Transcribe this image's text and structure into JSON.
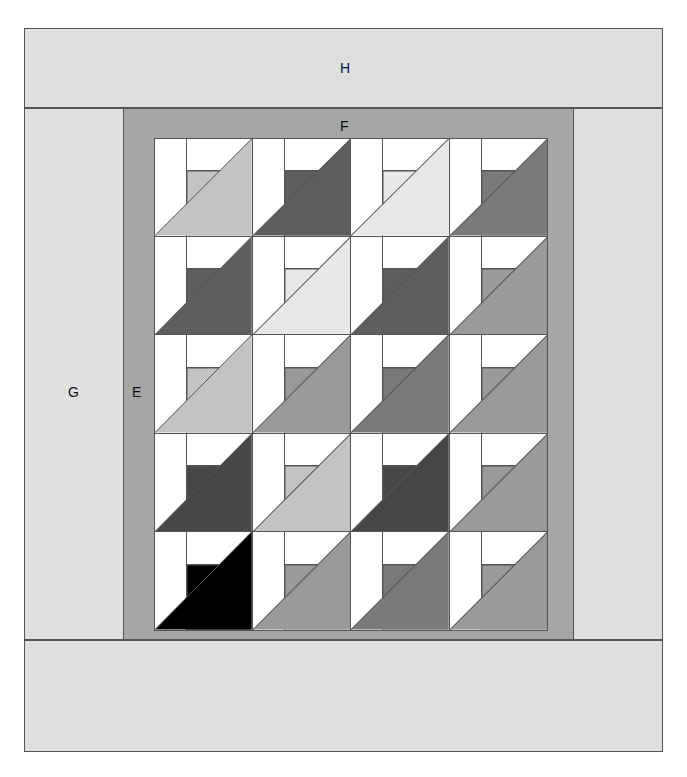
{
  "diagram": {
    "borders": [
      {
        "id": "H",
        "label": "H",
        "role": "outer-top-border",
        "color": "#dfdfdf"
      },
      {
        "id": "G",
        "label": "G",
        "role": "outer-side-border",
        "color": "#dfdfdf"
      },
      {
        "id": "F",
        "label": "F",
        "role": "inner-top-border",
        "color": "#a6a6a6"
      },
      {
        "id": "E",
        "label": "E",
        "role": "inner-side-border",
        "color": "#a6a6a6"
      }
    ],
    "grid": {
      "rows": 5,
      "columns": 4,
      "block_name": "half-square-triangle-block"
    },
    "palette": {
      "background_white": "#ffffff",
      "outline": "#555555",
      "outer_border": "#dfdfdf",
      "inner_border": "#a6a6a6",
      "very_light": "#e8e8e8",
      "light": "#c3c3c3",
      "medium": "#9a9a9a",
      "medium_dark": "#7a7a7a",
      "dark": "#5e5e5e",
      "very_dark": "#474747",
      "black": "#000000"
    },
    "blocks": [
      [
        {
          "triangle": "#c3c3c3",
          "square": "#c3c3c3"
        },
        {
          "triangle": "#5e5e5e",
          "square": "#5e5e5e"
        },
        {
          "triangle": "#e8e8e8",
          "square": "#e8e8e8"
        },
        {
          "triangle": "#7a7a7a",
          "square": "#7a7a7a"
        }
      ],
      [
        {
          "triangle": "#5e5e5e",
          "square": "#5e5e5e"
        },
        {
          "triangle": "#e8e8e8",
          "square": "#e8e8e8"
        },
        {
          "triangle": "#5e5e5e",
          "square": "#5e5e5e"
        },
        {
          "triangle": "#9a9a9a",
          "square": "#9a9a9a"
        }
      ],
      [
        {
          "triangle": "#c3c3c3",
          "square": "#c3c3c3"
        },
        {
          "triangle": "#9a9a9a",
          "square": "#9a9a9a"
        },
        {
          "triangle": "#7a7a7a",
          "square": "#7a7a7a"
        },
        {
          "triangle": "#9a9a9a",
          "square": "#9a9a9a"
        }
      ],
      [
        {
          "triangle": "#474747",
          "square": "#474747"
        },
        {
          "triangle": "#c3c3c3",
          "square": "#c3c3c3"
        },
        {
          "triangle": "#474747",
          "square": "#474747"
        },
        {
          "triangle": "#9a9a9a",
          "square": "#9a9a9a"
        }
      ],
      [
        {
          "triangle": "#000000",
          "square": "#000000"
        },
        {
          "triangle": "#9a9a9a",
          "square": "#9a9a9a"
        },
        {
          "triangle": "#7a7a7a",
          "square": "#7a7a7a"
        },
        {
          "triangle": "#9a9a9a",
          "square": "#9a9a9a"
        }
      ]
    ]
  }
}
